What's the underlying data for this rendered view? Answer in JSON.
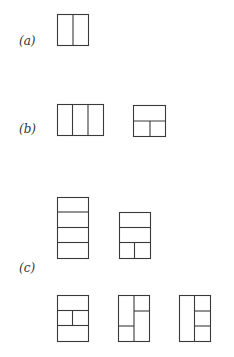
{
  "figure": {
    "stroke_color": "#3a3a3a",
    "background": "#ffffff",
    "groups": [
      {
        "label": "(a)",
        "panels": [
          {
            "description": "rectangle split into 2 vertical columns",
            "columns": 2,
            "rows": 1
          }
        ]
      },
      {
        "label": "(b)",
        "panels": [
          {
            "description": "rectangle split into 3 vertical columns",
            "columns": 3,
            "rows": 1
          },
          {
            "description": "rectangle split into top half and bottom half, bottom half split into 2 columns",
            "rows": 2,
            "bottom_row_columns": 2
          }
        ]
      },
      {
        "label": "(c)",
        "panels": [
          {
            "description": "tall rectangle split into 4 horizontal rows",
            "rows": 4,
            "columns": 1
          },
          {
            "description": "rectangle split into 3 rows, bottom row split into 2 columns",
            "rows": 3,
            "bottom_row_columns": 2
          },
          {
            "description": "rectangle split into 3 rows, middle row split into 2 columns",
            "rows": 3,
            "middle_row_columns": 2
          },
          {
            "description": "rectangle split into 2 columns; left column split into 2 rows (lower short), right column split into 2 rows (upper short)",
            "columns": 2,
            "left_column_rows": 2,
            "right_column_rows": 2
          },
          {
            "description": "rectangle split into 2 columns; right column split into 3 rows",
            "columns": 2,
            "left_column_rows": 1,
            "right_column_rows": 3
          }
        ]
      }
    ]
  }
}
